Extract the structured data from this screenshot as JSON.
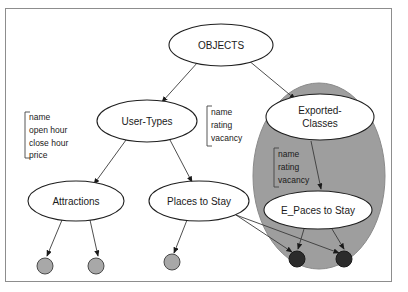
{
  "diagram": {
    "frame": {
      "border_color": "#8d8d8d",
      "background": "#ffffff"
    },
    "group": {
      "name": "exported-classes-region",
      "fill_color": "#9e9e9e",
      "label": ""
    },
    "nodes": [
      {
        "id": "objects",
        "label": "OBJECTS",
        "cx": 221,
        "cy": 45,
        "rx": 52,
        "ry": 21,
        "lines": [
          "OBJECTS"
        ]
      },
      {
        "id": "user-types",
        "label": "User-Types",
        "cx": 147,
        "cy": 121,
        "rx": 50,
        "ry": 21,
        "lines": [
          "User-Types"
        ]
      },
      {
        "id": "exported",
        "label": "Exported-Classes",
        "cx": 320,
        "cy": 117,
        "rx": 54,
        "ry": 23,
        "lines": [
          "Exported-",
          "Classes"
        ]
      },
      {
        "id": "attractions",
        "label": "Attractions",
        "cx": 76,
        "cy": 201,
        "rx": 48,
        "ry": 20,
        "lines": [
          "Attractions"
        ]
      },
      {
        "id": "places-to-stay",
        "label": "Places to Stay",
        "cx": 199,
        "cy": 201,
        "rx": 50,
        "ry": 20,
        "lines": [
          "Places to Stay"
        ]
      },
      {
        "id": "e-paces",
        "label": "E_Paces to Stay",
        "cx": 318,
        "cy": 210,
        "rx": 54,
        "ry": 19,
        "lines": [
          "E_Paces to Stay"
        ]
      }
    ],
    "attribute_lists": [
      {
        "id": "attractions-attrs",
        "x": 26,
        "y": 112,
        "items": [
          "name",
          "open hour",
          "close hour",
          "price"
        ]
      },
      {
        "id": "places-attrs",
        "x": 209,
        "y": 110,
        "items": [
          "name",
          "rating",
          "vacancy"
        ]
      },
      {
        "id": "exported-attrs",
        "x": 275,
        "y": 152,
        "items": [
          "name",
          "rating",
          "vacancy"
        ]
      }
    ],
    "instances": [
      {
        "id": "attr-inst-1",
        "cx": 45,
        "cy": 266,
        "r": 8,
        "tone": "light"
      },
      {
        "id": "attr-inst-2",
        "cx": 96,
        "cy": 266,
        "r": 8,
        "tone": "light"
      },
      {
        "id": "places-inst-1",
        "cx": 172,
        "cy": 262,
        "r": 8,
        "tone": "light"
      },
      {
        "id": "exported-inst-1",
        "cx": 297,
        "cy": 259,
        "r": 8,
        "tone": "dark"
      },
      {
        "id": "exported-inst-2",
        "cx": 344,
        "cy": 259,
        "r": 8,
        "tone": "dark"
      }
    ],
    "edges": [
      {
        "id": "objects-to-user-types",
        "from": "objects",
        "to": "user-types",
        "path": "M 198,62 L 162,102"
      },
      {
        "id": "objects-to-exported",
        "from": "objects",
        "to": "exported",
        "path": "M 248,60 L 295,99"
      },
      {
        "id": "user-types-to-attr",
        "from": "user-types",
        "to": "attractions",
        "path": "M 126,140 L 94,184"
      },
      {
        "id": "user-types-to-places",
        "from": "user-types",
        "to": "places-to-stay",
        "path": "M 170,140 L 192,182"
      },
      {
        "id": "exported-to-e-paces",
        "from": "exported",
        "to": "e-paces",
        "path": "M 311,141 L 321,189"
      },
      {
        "id": "attr-to-inst-1",
        "from": "attractions",
        "to": "attr-inst-1",
        "path": "M 62,220 L 47,256"
      },
      {
        "id": "attr-to-inst-2",
        "from": "attractions",
        "to": "attr-inst-2",
        "path": "M 90,220 L 98,256"
      },
      {
        "id": "places-to-inst-1",
        "from": "places-to-stay",
        "to": "places-inst-1",
        "path": "M 187,220 L 174,253"
      },
      {
        "id": "places-to-dark-1",
        "from": "places-to-stay",
        "to": "exported-inst-1",
        "path": "M 230,211 L 292,252"
      },
      {
        "id": "places-to-dark-2",
        "from": "places-to-stay",
        "to": "exported-inst-2",
        "path": "M 236,215 L 339,253"
      },
      {
        "id": "e-paces-to-dark-1",
        "from": "e-paces",
        "to": "exported-inst-1",
        "path": "M 304,229 L 298,249"
      },
      {
        "id": "e-paces-to-dark-2",
        "from": "e-paces",
        "to": "exported-inst-2",
        "path": "M 332,229 L 344,249"
      }
    ]
  }
}
